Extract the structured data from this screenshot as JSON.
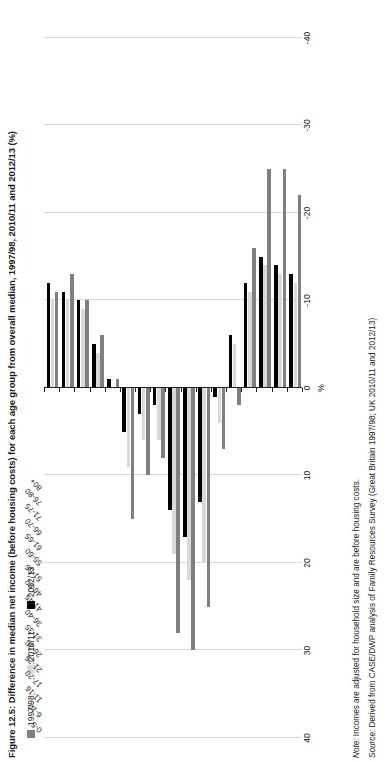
{
  "title": "Figure 12.5: Difference in median net income (before housing costs) for each age group from overall median, 1997/98, 2010/11 and 2012/13 (%)",
  "legend": {
    "items": [
      {
        "label": "1997/98",
        "color": "#7f7f7f"
      },
      {
        "label": "2010/11",
        "color": "#d9d9d9"
      },
      {
        "label": "2012/13",
        "color": "#000000"
      }
    ]
  },
  "axis": {
    "unit": "%",
    "ticks": [
      "40",
      "30",
      "20",
      "10",
      "0",
      "-10",
      "-20",
      "-30",
      "-40"
    ],
    "tick_values": [
      40,
      30,
      20,
      10,
      0,
      -10,
      -20,
      -30,
      -40
    ]
  },
  "footnotes": {
    "note_prefix": "Note:",
    "note_text": " Incomes are adjusted for household size and are before housing costs.",
    "source_prefix": "Source:",
    "source_text": " Derived from CASE/DWP analysis of Family Resources Survey (Great Britain 1997/98; UK 2010/11 and 2012/13)"
  },
  "chart_data": {
    "type": "bar",
    "orientation": "vertical",
    "title": "Figure 12.5: Difference in median net income (before housing costs) for each age group from overall median, 1997/98, 2010/11 and 2012/13 (%)",
    "xlabel": "",
    "ylabel": "%",
    "ylim": [
      -40,
      40
    ],
    "grid": true,
    "legend_position": "top-left",
    "categories": [
      "0-5",
      "6-10",
      "11-16",
      "17-20",
      "21-25",
      "26-30",
      "31-35",
      "36-40",
      "41-45",
      "46-50",
      "51-55",
      "55-60",
      "61-65",
      "66-70",
      "71-75",
      "76-80",
      "80+"
    ],
    "series": [
      {
        "name": "1997/98",
        "color": "#7f7f7f",
        "values": [
          -11,
          -13,
          -10,
          -6,
          -1,
          15,
          10,
          8,
          28,
          30,
          25,
          7,
          2,
          -16,
          -25,
          -25,
          -22
        ]
      },
      {
        "name": "2010/11",
        "color": "#d9d9d9",
        "values": [
          -10,
          -10,
          -9,
          -4,
          0,
          9,
          6,
          6,
          19,
          22,
          20,
          4,
          -5,
          -11,
          -14,
          -13,
          -12
        ]
      },
      {
        "name": "2012/13",
        "color": "#000000",
        "values": [
          -12,
          -11,
          -10,
          -5,
          -1,
          5,
          3,
          2,
          14,
          17,
          13,
          1,
          -6,
          -12,
          -15,
          -14,
          -13
        ]
      }
    ]
  }
}
